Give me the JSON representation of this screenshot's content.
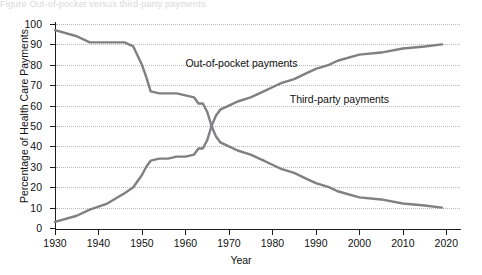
{
  "top_caption": "Figure  Out-of-pocket versus third-party payments",
  "chart_data": {
    "type": "line",
    "title": "",
    "xlabel": "Year",
    "ylabel": "Percentage of Health Care Payments",
    "xlim": [
      1930,
      2022
    ],
    "ylim": [
      0,
      100
    ],
    "xticks": [
      1930,
      1940,
      1950,
      1960,
      1970,
      1980,
      1990,
      2000,
      2010,
      2020
    ],
    "yticks": [
      0,
      10,
      20,
      30,
      40,
      50,
      60,
      70,
      80,
      90,
      100
    ],
    "grid": "horizontal-dotted",
    "legend_position": "inline-annotations",
    "line_color": "#808084",
    "series": [
      {
        "name": "Out-of-pocket payments",
        "label_x": 1960,
        "label_y": 81,
        "x": [
          1930,
          1935,
          1938,
          1942,
          1946,
          1948,
          1950,
          1951,
          1952,
          1954,
          1956,
          1958,
          1960,
          1962,
          1963,
          1964,
          1965,
          1966,
          1967,
          1968,
          1970,
          1972,
          1975,
          1978,
          1980,
          1982,
          1985,
          1988,
          1990,
          1993,
          1995,
          2000,
          2005,
          2010,
          2015,
          2019
        ],
        "values": [
          97,
          94,
          91,
          91,
          91,
          89,
          80,
          74,
          67,
          66,
          66,
          66,
          65,
          64,
          61,
          61,
          57,
          50,
          45,
          42,
          40,
          38,
          36,
          33,
          31,
          29,
          27,
          24,
          22,
          20,
          18,
          15,
          14,
          12,
          11,
          10
        ]
      },
      {
        "name": "Third-party payments",
        "label_x": 1984,
        "label_y": 63,
        "x": [
          1930,
          1935,
          1938,
          1942,
          1946,
          1948,
          1950,
          1951,
          1952,
          1954,
          1956,
          1958,
          1960,
          1962,
          1963,
          1964,
          1965,
          1966,
          1967,
          1968,
          1970,
          1972,
          1975,
          1978,
          1980,
          1982,
          1985,
          1988,
          1990,
          1993,
          1995,
          2000,
          2005,
          2010,
          2015,
          2019
        ],
        "values": [
          3,
          6,
          9,
          12,
          17,
          20,
          26,
          30,
          33,
          34,
          34,
          35,
          35,
          36,
          39,
          39,
          43,
          50,
          55,
          58,
          60,
          62,
          64,
          67,
          69,
          71,
          73,
          76,
          78,
          80,
          82,
          85,
          86,
          88,
          89,
          90
        ]
      }
    ]
  }
}
